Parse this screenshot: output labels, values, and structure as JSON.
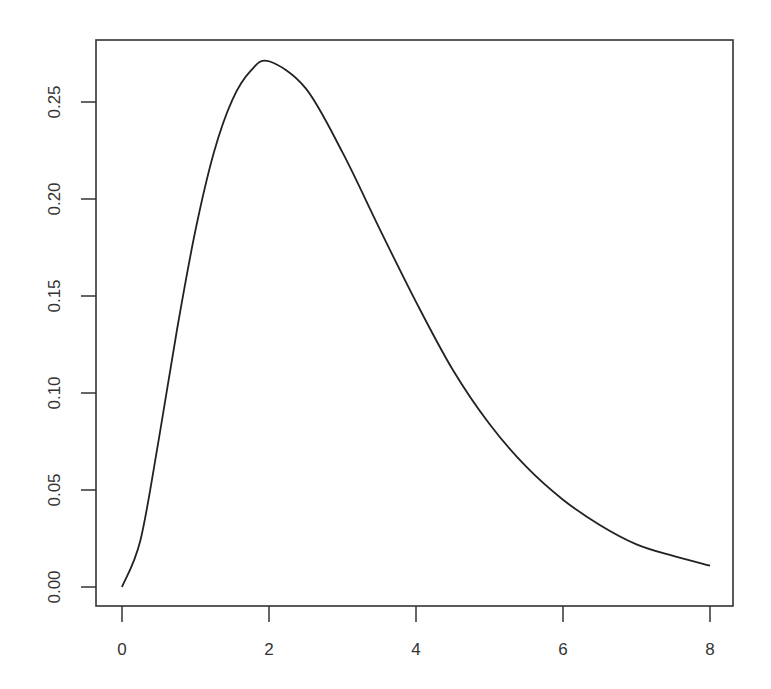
{
  "chart_data": {
    "type": "line",
    "title": "",
    "xlabel": "",
    "ylabel": "",
    "xlim": [
      0,
      8
    ],
    "ylim": [
      0,
      0.27
    ],
    "grid": false,
    "legend": null,
    "x_ticks": [
      "0",
      "2",
      "4",
      "6",
      "8"
    ],
    "y_ticks": [
      "0.00",
      "0.05",
      "0.10",
      "0.15",
      "0.20",
      "0.25"
    ],
    "series": [
      {
        "name": "density",
        "x": [
          0,
          0.25,
          0.5,
          0.75,
          1,
          1.25,
          1.5,
          1.75,
          2,
          2.5,
          3,
          3.5,
          4,
          4.5,
          5,
          5.5,
          6,
          6.5,
          7,
          7.5,
          8
        ],
        "y": [
          0.0,
          0.024,
          0.076,
          0.133,
          0.184,
          0.224,
          0.251,
          0.266,
          0.271,
          0.257,
          0.224,
          0.185,
          0.147,
          0.112,
          0.084,
          0.062,
          0.045,
          0.032,
          0.022,
          0.016,
          0.011
        ]
      }
    ],
    "line_color": "#222222"
  }
}
